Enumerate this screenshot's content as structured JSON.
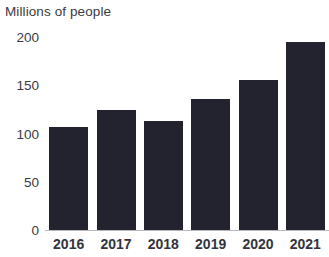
{
  "chart_data": {
    "type": "bar",
    "title": "Millions of people",
    "xlabel": "",
    "ylabel": "Millions of people",
    "categories": [
      "2016",
      "2017",
      "2018",
      "2019",
      "2020",
      "2021"
    ],
    "values": [
      108,
      125,
      114,
      137,
      156,
      196
    ],
    "ylim": [
      0,
      200
    ],
    "y_ticks": [
      "200",
      "150",
      "100",
      "50",
      "0"
    ],
    "y_tick_values": [
      200,
      150,
      100,
      50,
      0
    ],
    "grid": false,
    "legend": null,
    "bar_color": "#22232e",
    "axis_color": "#b9b9bd",
    "text_color": "#3b3b43",
    "background": "#ffffff"
  }
}
